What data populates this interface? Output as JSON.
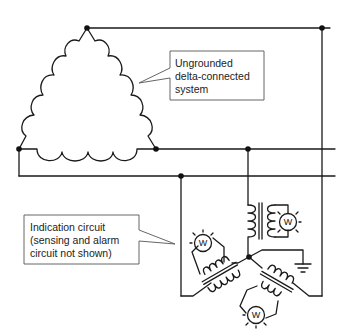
{
  "diagram": {
    "callouts": [
      {
        "id": "system",
        "lines": [
          "Ungrounded",
          "delta-connected",
          "system"
        ]
      },
      {
        "id": "indication",
        "lines": [
          "Indication circuit",
          "(sensing and alarm",
          "circuit not shown)"
        ]
      }
    ],
    "meters": [
      {
        "label": "W",
        "position": "right"
      },
      {
        "label": "W",
        "position": "left"
      },
      {
        "label": "W",
        "position": "bottom"
      }
    ],
    "components": {
      "source": "delta-connected windings (3 coils)",
      "buses": 3,
      "transformers": 3,
      "ground_symbol": "ground"
    },
    "colors": {
      "line": "#1a1a1a",
      "callout_border": "#555555",
      "background": "#ffffff"
    }
  }
}
